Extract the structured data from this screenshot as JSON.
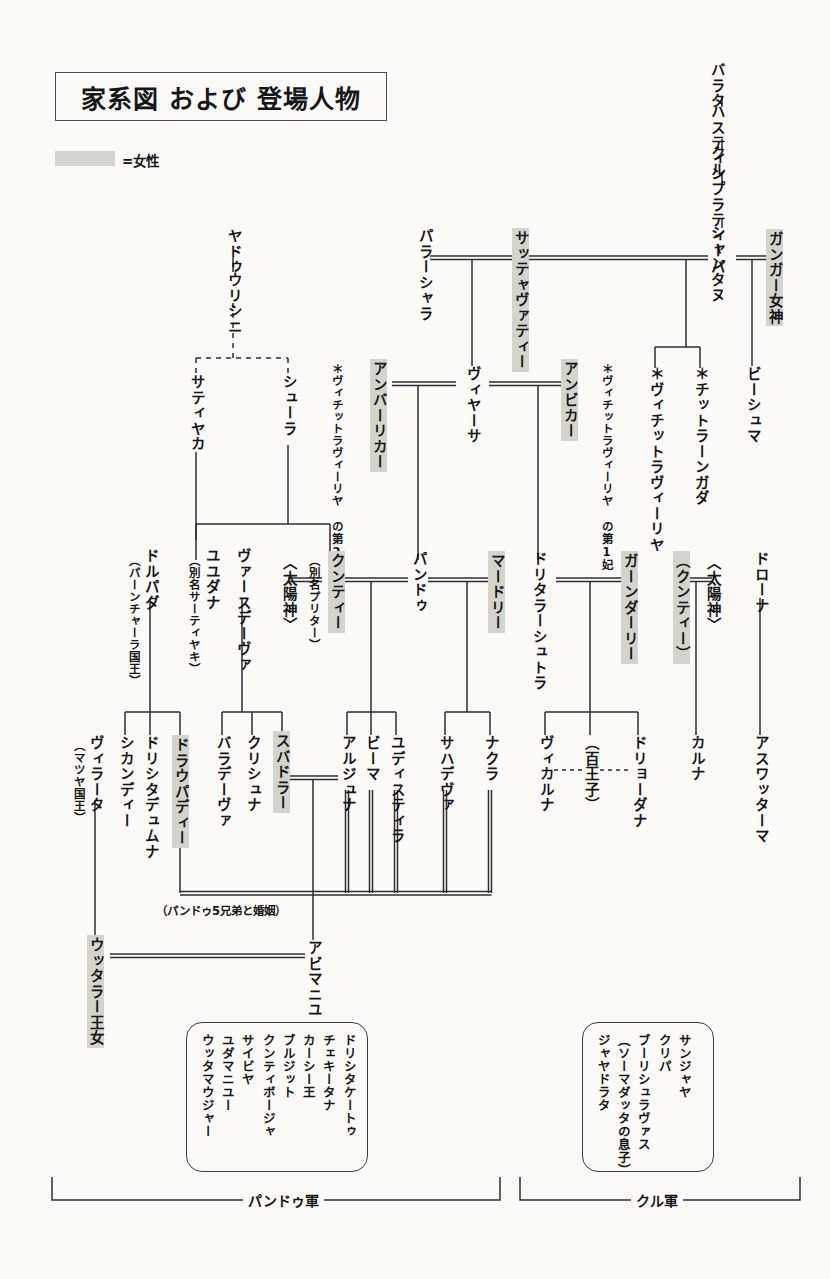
{
  "title": "家系図 および 登場人物",
  "legend": {
    "swatch_label": "=女性",
    "female_color": "#d3d4cb"
  },
  "colors": {
    "ink": "#15161a",
    "line": "#2b2e33",
    "paper": "#fbfaf7",
    "female": "#d3d4cb"
  },
  "people": {
    "barata": "バラタ",
    "hastin": "ハスティン",
    "kuru": "クル",
    "pratipa": "プラティーパ",
    "shantanu": "シャンタヌ",
    "ganga": "ガンガー女神",
    "bhishma": "ビーシュマ",
    "chitrangada": "＊チットラーンガダ",
    "vichitravirya": "＊ヴィチットラヴィーリヤ",
    "parashara": "パラーシャラ",
    "satyavati": "サッテャヴァティー",
    "vyasa": "ヴィヤーサ",
    "ambika": "アンビカー",
    "ambika_note": "＊ヴィチットラヴィーリヤ\nの第1妃",
    "ambalika": "アンバーリカー",
    "ambalika_note": "＊ヴィチットラヴィーリヤ\nの第2妃",
    "yadu": "ヤドゥ",
    "vrishni": "ウリシニ",
    "satyaka": "サティヤカ",
    "shura": "シューラ",
    "yuyudhana": "ユユダナ",
    "yuyudhana_alias": "（別名サーティヤキ）",
    "vasudeva": "ヴァースデーヴァ",
    "kunti": "クンティー",
    "kunti_alias": "（別名プリター）",
    "surya": "〈太陽神〉",
    "pandu": "パンドゥ",
    "madri": "マードリー",
    "dhritarashtra": "ドリタラーシュトラ",
    "gandhari": "ガーンダーリー",
    "kunti2": "（クンティー）",
    "surya2": "〈太陽神〉",
    "drona": "ドローナ",
    "drupada": "ドルパダ",
    "drupada_note": "（パーンチャーラ国王）",
    "virata": "ヴィラータ",
    "virata_note": "（マツヤ国王）",
    "shikhandi": "シカンディー",
    "dhrishtadyumna": "ドリシタデュムナ",
    "draupadi": "ドラウパディー",
    "baladeva": "バラデーヴァ",
    "krishna": "クリシュナ",
    "subhadra": "スバドラー",
    "arjuna": "アルジュナ",
    "bhima": "ビーマ",
    "yudhishthira": "ユディスティラ",
    "sahadeva": "サハデヴァ",
    "nakula": "ナクラ",
    "vikarna": "ヴィカルナ",
    "hundred_princes": "（百王子）",
    "duryodhana": "ドリョーダナ",
    "karna": "カルナ",
    "ashwatthama": "アスワッターマ",
    "uttara": "ウッタラー王女",
    "abhimanyu": "アビマニユ"
  },
  "notes": {
    "draupadi_marriage": "（パンドゥ5兄弟と婚姻）"
  },
  "pandava_army": {
    "label": "パンドゥ軍",
    "members": [
      "ドリシタケートゥ",
      "チェキータナ",
      "カーシー王",
      "ブルジット",
      "クンティボージャ",
      "サイビヤ",
      "ユダマニユー",
      "ウッタマウジャー"
    ]
  },
  "kuru_army": {
    "label": "クル軍",
    "members": [
      "サンジャヤ",
      "クリパ",
      "ブーリシュラヴァス",
      "（ソーマダッタの息子）",
      "ジャヤドラタ"
    ]
  }
}
